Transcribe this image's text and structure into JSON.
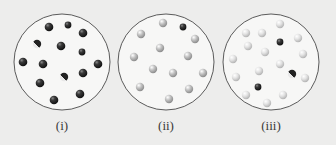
{
  "figure": {
    "panels": [
      {
        "label": "(i)",
        "center": [
          62,
          62
        ],
        "radius": 48,
        "particles": [
          {
            "x": 49,
            "y": 27,
            "type": "dark"
          },
          {
            "x": 68,
            "y": 25,
            "type": "dark-small"
          },
          {
            "x": 83,
            "y": 33,
            "type": "dark"
          },
          {
            "x": 37,
            "y": 44,
            "type": "dark-mixed"
          },
          {
            "x": 61,
            "y": 46,
            "type": "dark"
          },
          {
            "x": 82,
            "y": 52,
            "type": "dark-small"
          },
          {
            "x": 23,
            "y": 62,
            "type": "dark"
          },
          {
            "x": 43,
            "y": 64,
            "type": "dark"
          },
          {
            "x": 98,
            "y": 64,
            "type": "dark"
          },
          {
            "x": 64,
            "y": 77,
            "type": "dark-mixed"
          },
          {
            "x": 83,
            "y": 73,
            "type": "dark"
          },
          {
            "x": 40,
            "y": 83,
            "type": "dark"
          },
          {
            "x": 80,
            "y": 94,
            "type": "dark"
          },
          {
            "x": 54,
            "y": 100,
            "type": "dark"
          }
        ]
      },
      {
        "label": "(ii)",
        "center": [
          166,
          62
        ],
        "radius": 48,
        "particles": [
          {
            "x": 163,
            "y": 23,
            "type": "light"
          },
          {
            "x": 183,
            "y": 27,
            "type": "dark-small"
          },
          {
            "x": 141,
            "y": 34,
            "type": "light"
          },
          {
            "x": 195,
            "y": 39,
            "type": "light"
          },
          {
            "x": 160,
            "y": 48,
            "type": "light"
          },
          {
            "x": 188,
            "y": 56,
            "type": "light"
          },
          {
            "x": 134,
            "y": 57,
            "type": "light"
          },
          {
            "x": 153,
            "y": 69,
            "type": "light"
          },
          {
            "x": 173,
            "y": 73,
            "type": "light"
          },
          {
            "x": 203,
            "y": 73,
            "type": "light"
          },
          {
            "x": 140,
            "y": 87,
            "type": "light"
          },
          {
            "x": 189,
            "y": 89,
            "type": "light"
          },
          {
            "x": 169,
            "y": 99,
            "type": "light"
          }
        ]
      },
      {
        "label": "(iii)",
        "center": [
          271,
          62
        ],
        "radius": 48,
        "particles": [
          {
            "x": 280,
            "y": 24,
            "type": "pale"
          },
          {
            "x": 246,
            "y": 33,
            "type": "pale"
          },
          {
            "x": 262,
            "y": 33,
            "type": "pale"
          },
          {
            "x": 280,
            "y": 42,
            "type": "dark-small"
          },
          {
            "x": 298,
            "y": 38,
            "type": "pale"
          },
          {
            "x": 248,
            "y": 46,
            "type": "pale"
          },
          {
            "x": 265,
            "y": 52,
            "type": "pale"
          },
          {
            "x": 303,
            "y": 54,
            "type": "pale"
          },
          {
            "x": 233,
            "y": 59,
            "type": "pale"
          },
          {
            "x": 280,
            "y": 64,
            "type": "pale"
          },
          {
            "x": 259,
            "y": 71,
            "type": "pale"
          },
          {
            "x": 292,
            "y": 74,
            "type": "dark-mixed"
          },
          {
            "x": 236,
            "y": 77,
            "type": "pale"
          },
          {
            "x": 305,
            "y": 78,
            "type": "pale"
          },
          {
            "x": 258,
            "y": 87,
            "type": "dark-small"
          },
          {
            "x": 246,
            "y": 95,
            "type": "pale"
          },
          {
            "x": 283,
            "y": 95,
            "type": "pale"
          },
          {
            "x": 267,
            "y": 103,
            "type": "pale"
          }
        ]
      }
    ],
    "colors": {
      "background": "#ededec",
      "circle_fill": "#f7f7f6",
      "circle_stroke": "#4a4a4a",
      "dark": "#2b2b2b",
      "light": "#b8b8b8",
      "pale": "#d8d8d8",
      "caption": "#3a3a3a"
    }
  }
}
